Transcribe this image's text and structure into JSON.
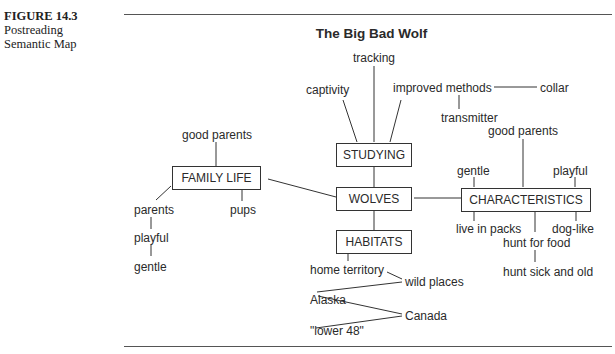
{
  "caption": {
    "figure_number": "FIGURE 14.3",
    "line1": "Postreading",
    "line2": "Semantic Map"
  },
  "title": "The Big Bad Wolf",
  "nodes": {
    "center": "WOLVES",
    "studying": {
      "label": "STUDYING",
      "children": [
        "captivity",
        "tracking",
        "improved methods"
      ],
      "improved_methods_children": [
        "collar",
        "transmitter"
      ]
    },
    "family_life": {
      "label": "FAMILY LIFE",
      "children": [
        "good parents",
        "pups",
        "parents"
      ],
      "parents_children": [
        "playful",
        "gentle"
      ]
    },
    "characteristics": {
      "label": "CHARACTERISTICS",
      "top": [
        "gentle",
        "good parents",
        "playful"
      ],
      "bottom": [
        "live in packs",
        "hunt for food",
        "dog-like"
      ],
      "hunt_children": [
        "hunt sick and old"
      ]
    },
    "habitats": {
      "label": "HABITATS",
      "children": [
        "home territory",
        "wild places",
        "Alaska",
        "Canada",
        "\"lower 48\""
      ]
    }
  }
}
